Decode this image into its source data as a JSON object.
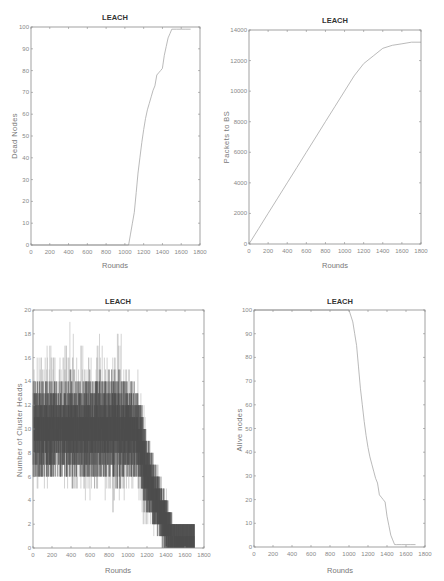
{
  "chart_data": [
    {
      "id": "dead-nodes",
      "type": "line",
      "title": "LEACH",
      "xlabel": "Rounds",
      "ylabel": "Dead Nodes",
      "xlim": [
        0,
        1800
      ],
      "ylim": [
        0,
        100
      ],
      "xticks": [
        0,
        200,
        400,
        600,
        800,
        1000,
        1200,
        1400,
        1600,
        1800
      ],
      "yticks": [
        0,
        10,
        20,
        30,
        40,
        50,
        60,
        70,
        80,
        90,
        100
      ],
      "grid": false,
      "x": [
        0,
        1040,
        1060,
        1080,
        1100,
        1120,
        1140,
        1160,
        1180,
        1200,
        1220,
        1240,
        1260,
        1280,
        1300,
        1320,
        1340,
        1360,
        1380,
        1400,
        1420,
        1440,
        1460,
        1480,
        1500,
        1550,
        1600,
        1650,
        1700
      ],
      "y": [
        0,
        0,
        5,
        10,
        15,
        24,
        33,
        40,
        47,
        53,
        58,
        62,
        65,
        68,
        71,
        73,
        78,
        79,
        80,
        81,
        87,
        91,
        95,
        97,
        99,
        99,
        99,
        99,
        99
      ]
    },
    {
      "id": "packets-to-bs",
      "type": "line",
      "title": "LEACH",
      "xlabel": "Rounds",
      "ylabel": "Packets to BS",
      "xlim": [
        0,
        1800
      ],
      "ylim": [
        0,
        14000
      ],
      "xticks": [
        0,
        200,
        400,
        600,
        800,
        1000,
        1200,
        1400,
        1600,
        1800
      ],
      "yticks": [
        0,
        2000,
        4000,
        6000,
        8000,
        10000,
        12000,
        14000
      ],
      "grid": false,
      "x": [
        0,
        100,
        200,
        300,
        400,
        500,
        600,
        700,
        800,
        900,
        1000,
        1100,
        1200,
        1300,
        1400,
        1500,
        1600,
        1700,
        1800
      ],
      "y": [
        0,
        1000,
        2000,
        3000,
        4000,
        5000,
        6000,
        7000,
        8000,
        9000,
        10000,
        11000,
        11800,
        12300,
        12800,
        13000,
        13100,
        13200,
        13200
      ]
    },
    {
      "id": "cluster-heads",
      "type": "line",
      "title": "LEACH",
      "xlabel": "Rounds",
      "ylabel": "Number of Cluster Heads",
      "xlim": [
        0,
        1800
      ],
      "ylim": [
        0,
        20
      ],
      "xticks": [
        0,
        200,
        400,
        600,
        800,
        1000,
        1200,
        1400,
        1600,
        1800
      ],
      "yticks": [
        0,
        2,
        4,
        6,
        8,
        10,
        12,
        14,
        16,
        18,
        20
      ],
      "grid": false,
      "note": "Noisy per-round count; mean about 10 from round 0 to 1100, then declining to 0-1 by round 1450-1700",
      "envelope": {
        "x": [
          0,
          100,
          200,
          300,
          400,
          500,
          600,
          700,
          800,
          900,
          1000,
          1100,
          1200,
          1300,
          1400,
          1450,
          1500,
          1600,
          1700
        ],
        "mean": [
          10,
          10,
          10,
          10,
          10,
          10,
          10,
          10,
          10,
          10,
          10,
          9.5,
          6,
          4,
          2,
          1,
          0.5,
          0.5,
          0.5
        ],
        "max": [
          15,
          17,
          17,
          16,
          19,
          17,
          16,
          18,
          16,
          19,
          15,
          15,
          10,
          7,
          5,
          3,
          1,
          1,
          1
        ],
        "min": [
          4,
          5,
          5,
          5,
          5,
          5,
          3,
          5,
          3,
          3,
          5,
          4,
          1,
          1,
          0,
          0,
          0,
          0,
          0
        ]
      }
    },
    {
      "id": "alive-nodes",
      "type": "line",
      "title": "LEACH",
      "xlabel": "Rounds",
      "ylabel": "Alive nodes",
      "xlim": [
        0,
        1800
      ],
      "ylim": [
        0,
        100
      ],
      "xticks": [
        0,
        200,
        400,
        600,
        800,
        1000,
        1200,
        1400,
        1600,
        1800
      ],
      "yticks": [
        0,
        10,
        20,
        30,
        40,
        50,
        60,
        70,
        80,
        90,
        100
      ],
      "grid": false,
      "x": [
        0,
        1000,
        1040,
        1060,
        1080,
        1100,
        1120,
        1140,
        1160,
        1180,
        1200,
        1220,
        1240,
        1260,
        1280,
        1300,
        1320,
        1340,
        1360,
        1380,
        1400,
        1420,
        1440,
        1460,
        1480,
        1500,
        1550,
        1600,
        1650,
        1700
      ],
      "y": [
        100,
        100,
        95,
        90,
        85,
        76,
        67,
        60,
        53,
        47,
        42,
        38,
        35,
        32,
        29,
        27,
        22,
        21,
        20,
        19,
        13,
        9,
        5,
        3,
        1,
        1,
        1,
        1,
        1,
        1
      ]
    }
  ],
  "panels": [
    {
      "title": "LEACH",
      "xlabel": "Rounds",
      "ylabel": "Dead Nodes"
    },
    {
      "title": "LEACH",
      "xlabel": "Rounds",
      "ylabel": "Packets to BS"
    },
    {
      "title": "LEACH",
      "xlabel": "Rounds",
      "ylabel": "Number of Cluster Heads"
    },
    {
      "title": "LEACH",
      "xlabel": "Rounds",
      "ylabel": "Alive nodes"
    }
  ],
  "colors": {
    "axes": "#8a8a8a",
    "line": "#a8a8a8",
    "noise_light": "#b5b5b5",
    "noise_dark": "#4a4a4a"
  }
}
